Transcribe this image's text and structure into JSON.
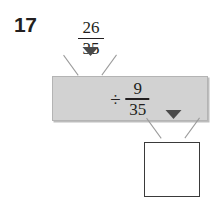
{
  "problem": {
    "number": "17",
    "type": "function-machine",
    "input_fraction": {
      "numerator": "26",
      "denominator": "35"
    },
    "operation": {
      "symbol": "÷",
      "symbol_name": "division-sign",
      "operand_fraction": {
        "numerator": "9",
        "denominator": "35"
      }
    },
    "answer": {
      "value": "",
      "placeholder": ""
    },
    "icons": {
      "arrow_top": "arrow-down-icon",
      "arrow_bottom": "arrow-down-icon"
    },
    "colors": {
      "ink": "#231f20",
      "machine_fill": "#d2d2d2",
      "machine_border": "#b4b4b4",
      "arrow": "#4a4a4a",
      "funnel_line": "#9a9a9a",
      "answer_border": "#3a3a3a",
      "page_background": "#ffffff"
    }
  }
}
